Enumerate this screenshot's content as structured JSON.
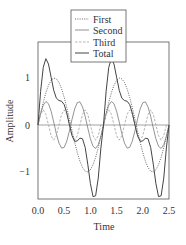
{
  "chart_data": {
    "type": "line",
    "title": "",
    "xlabel": "Time",
    "ylabel": "Amplitude",
    "xlim": [
      0.0,
      2.5
    ],
    "ylim": [
      -1.75,
      1.75
    ],
    "xticks": [
      "0.0",
      "0.5",
      "1.0",
      "1.5",
      "2.0",
      "2.5"
    ],
    "yticks": [
      "1",
      "0",
      "−1"
    ],
    "grid": false,
    "zero_line": true,
    "legend_position": "top-center, overlapping plot frame",
    "x": [
      0.0,
      0.05,
      0.1,
      0.15,
      0.2,
      0.25,
      0.3,
      0.35,
      0.4,
      0.45,
      0.5,
      0.55,
      0.6,
      0.65,
      0.7,
      0.75,
      0.8,
      0.85,
      0.9,
      0.95,
      1.0,
      1.05,
      1.1,
      1.15,
      1.2,
      1.25,
      1.3,
      1.35,
      1.4,
      1.45,
      1.5,
      1.55,
      1.6,
      1.65,
      1.7,
      1.75,
      1.8,
      1.85,
      1.9,
      1.95,
      2.0,
      2.05,
      2.1,
      2.15,
      2.2,
      2.25,
      2.3,
      2.35,
      2.4,
      2.45,
      2.5
    ],
    "series": [
      {
        "name": "First",
        "style": "dotted",
        "values": [
          0.0,
          0.249,
          0.482,
          0.685,
          0.844,
          0.951,
          0.998,
          0.982,
          0.905,
          0.771,
          0.588,
          0.368,
          0.125,
          -0.125,
          -0.368,
          -0.588,
          -0.771,
          -0.905,
          -0.982,
          -0.998,
          -0.951,
          -0.844,
          -0.685,
          -0.482,
          -0.249,
          0.0,
          0.249,
          0.482,
          0.685,
          0.844,
          0.951,
          0.998,
          0.982,
          0.905,
          0.771,
          0.588,
          0.368,
          0.125,
          -0.125,
          -0.368,
          -0.588,
          -0.771,
          -0.905,
          -0.982,
          -0.998,
          -0.951,
          -0.844,
          -0.685,
          -0.482,
          -0.249,
          0.0
        ]
      },
      {
        "name": "Second",
        "style": "solid-thin",
        "values": [
          0.0,
          0.241,
          0.421,
          0.499,
          0.453,
          0.294,
          0.062,
          -0.184,
          -0.384,
          -0.492,
          -0.476,
          -0.342,
          -0.124,
          0.124,
          0.342,
          0.476,
          0.492,
          0.384,
          0.184,
          -0.062,
          -0.294,
          -0.453,
          -0.499,
          -0.421,
          -0.241,
          0.0,
          0.241,
          0.421,
          0.499,
          0.453,
          0.294,
          0.062,
          -0.184,
          -0.384,
          -0.492,
          -0.476,
          -0.342,
          -0.124,
          0.124,
          0.342,
          0.476,
          0.492,
          0.384,
          0.184,
          -0.062,
          -0.294,
          -0.453,
          -0.499,
          -0.421,
          -0.241,
          0.0
        ]
      },
      {
        "name": "Third",
        "style": "dashed-light",
        "values": [
          0.0,
          0.227,
          0.322,
          0.227,
          0.0,
          -0.227,
          -0.322,
          -0.227,
          0.0,
          0.227,
          0.322,
          0.227,
          0.0,
          -0.227,
          -0.322,
          -0.227,
          0.0,
          0.227,
          0.322,
          0.227,
          0.0,
          -0.227,
          -0.322,
          -0.227,
          0.0,
          0.0,
          0.227,
          0.322,
          0.227,
          0.0,
          -0.227,
          -0.322,
          -0.227,
          0.0,
          0.227,
          0.322,
          0.227,
          0.0,
          -0.227,
          -0.322,
          -0.227,
          0.0,
          0.227,
          0.322,
          0.227,
          0.0,
          -0.227,
          -0.322,
          -0.227,
          0.0,
          0.0
        ]
      },
      {
        "name": "Total",
        "style": "solid",
        "values": [
          0.0,
          0.717,
          1.225,
          1.411,
          1.297,
          1.018,
          0.738,
          0.571,
          0.521,
          0.506,
          0.434,
          0.253,
          0.001,
          -0.228,
          -0.348,
          -0.339,
          -0.279,
          -0.294,
          -0.476,
          -0.833,
          -1.245,
          -1.524,
          -1.506,
          -1.13,
          -0.49,
          0.0,
          0.717,
          1.225,
          1.411,
          1.297,
          1.018,
          0.738,
          0.571,
          0.521,
          0.506,
          0.434,
          0.253,
          0.001,
          -0.228,
          -0.348,
          -0.339,
          -0.279,
          -0.294,
          -0.476,
          -0.833,
          -1.245,
          -1.524,
          -1.506,
          -1.13,
          -0.49,
          0.0
        ]
      }
    ]
  },
  "legend": {
    "items": [
      {
        "label": "First",
        "style": "dotted"
      },
      {
        "label": "Second",
        "style": "solid-thin"
      },
      {
        "label": "Third",
        "style": "dashed-light"
      },
      {
        "label": "Total",
        "style": "solid"
      }
    ]
  },
  "colors": {
    "axis": "#555555",
    "first": "#555555",
    "second": "#777777",
    "third": "#aaaaaa",
    "total": "#444444"
  }
}
